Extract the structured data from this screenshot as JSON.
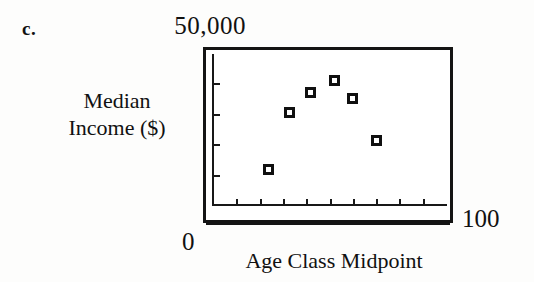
{
  "figure": {
    "panel_letter": "c.",
    "background_color": "#fdfdfc",
    "ink_color": "#111111"
  },
  "labels": {
    "y_max": "50,000",
    "y_axis_title_line1": "Median",
    "y_axis_title_line2": "Income ($)",
    "x_min": "0",
    "x_max": "100",
    "x_axis_title": "Age Class Midpoint"
  },
  "chart_data": {
    "type": "scatter",
    "title": "",
    "xlabel": "Age Class Midpoint",
    "ylabel": "Median Income ($)",
    "xlim": [
      0,
      100
    ],
    "ylim": [
      0,
      50000
    ],
    "xticklabels": [
      "0",
      "100"
    ],
    "yticklabels": [
      "50,000"
    ],
    "xtick_values": [
      10,
      20,
      30,
      40,
      50,
      60,
      70,
      80,
      90
    ],
    "ytick_values": [
      10000,
      20000,
      30000,
      40000
    ],
    "grid": false,
    "legend": null,
    "marker_style": "open-center filled square",
    "marker_color": "#101010",
    "series": [
      {
        "name": "Median income by age class",
        "points": [
          {
            "x": 24,
            "y": 11800
          },
          {
            "x": 33,
            "y": 30500
          },
          {
            "x": 42,
            "y": 37100
          },
          {
            "x": 52,
            "y": 40800
          },
          {
            "x": 60,
            "y": 35000
          },
          {
            "x": 70,
            "y": 21300
          }
        ]
      }
    ]
  }
}
